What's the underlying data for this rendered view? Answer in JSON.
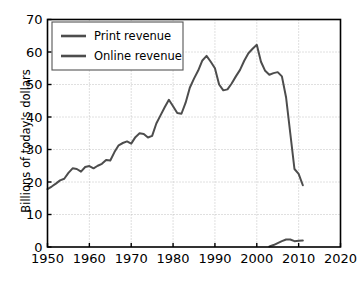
{
  "chart_data": {
    "type": "line",
    "title": "",
    "xlabel": "",
    "ylabel": "Billions of today's dollars",
    "xlim": [
      1950,
      2020
    ],
    "ylim": [
      0,
      70
    ],
    "xticks": [
      1950,
      1960,
      1970,
      1980,
      1990,
      2000,
      2010,
      2020
    ],
    "yticks": [
      0,
      10,
      20,
      30,
      40,
      50,
      60,
      70
    ],
    "xtick_labels": [
      "1950",
      "1960",
      "1970",
      "1980",
      "1990",
      "2000",
      "2010",
      "2020"
    ],
    "ytick_labels": [
      "0",
      "10",
      "20",
      "30",
      "40",
      "50",
      "60",
      "70"
    ],
    "grid": true,
    "grid_style": "dotted",
    "legend_position": "upper left",
    "series": [
      {
        "name": "Print revenue",
        "color": "#4d4d4d",
        "x": [
          1950,
          1951,
          1952,
          1953,
          1954,
          1955,
          1956,
          1957,
          1958,
          1959,
          1960,
          1961,
          1962,
          1963,
          1964,
          1965,
          1966,
          1967,
          1968,
          1969,
          1970,
          1971,
          1972,
          1973,
          1974,
          1975,
          1976,
          1977,
          1978,
          1979,
          1980,
          1981,
          1982,
          1983,
          1984,
          1985,
          1986,
          1987,
          1988,
          1989,
          1990,
          1991,
          1992,
          1993,
          1994,
          1995,
          1996,
          1997,
          1998,
          1999,
          2000,
          2001,
          2002,
          2003,
          2004,
          2005,
          2006,
          2007,
          2008,
          2009,
          2010,
          2011
        ],
        "values": [
          17.8,
          18.6,
          19.5,
          20.5,
          21.0,
          22.8,
          24.2,
          24.0,
          23.2,
          24.6,
          24.9,
          24.2,
          25.0,
          25.6,
          26.8,
          26.6,
          29.2,
          31.3,
          32.0,
          32.5,
          31.8,
          33.8,
          35.0,
          34.8,
          33.7,
          34.2,
          38.0,
          40.5,
          43.0,
          45.3,
          43.3,
          41.2,
          41.0,
          44.4,
          49.0,
          51.8,
          54.3,
          57.4,
          58.8,
          57.0,
          55.0,
          50.0,
          48.2,
          48.5,
          50.3,
          52.5,
          54.5,
          57.3,
          59.6,
          61.0,
          62.2,
          57.0,
          54.2,
          53.0,
          53.5,
          53.8,
          52.5,
          46.0,
          35.0,
          24.0,
          22.5,
          19.0
        ],
        "linewidth": 2.0
      },
      {
        "name": "Online revenue",
        "color": "#4d4d4d",
        "x": [
          2003,
          2004,
          2005,
          2006,
          2007,
          2008,
          2009,
          2010,
          2011
        ],
        "values": [
          0.2,
          0.6,
          1.2,
          1.8,
          2.3,
          2.3,
          1.8,
          1.9,
          2.0
        ],
        "linewidth": 2.0
      }
    ]
  },
  "legend": {
    "entries": [
      {
        "label": "Print revenue",
        "swatch_color": "#4d4d4d"
      },
      {
        "label": "Online revenue",
        "swatch_color": "#4d4d4d"
      }
    ]
  },
  "axes": {
    "y_title": "Billions of today's dollars",
    "frame_color": "#000000",
    "grid_color": "#b0b0b0"
  }
}
